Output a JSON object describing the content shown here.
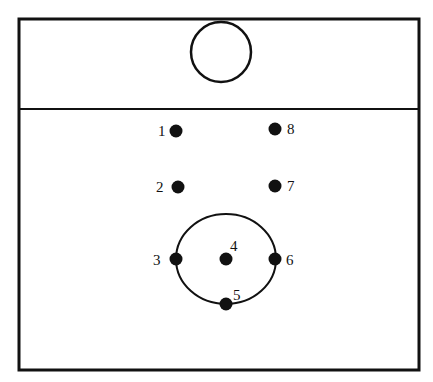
{
  "diagram": {
    "court": {
      "x": 19,
      "y": 19,
      "width": 400,
      "height": 351,
      "stroke": "#111111"
    },
    "divider_line_y": 109,
    "top_circle": {
      "cx": 221,
      "cy": 52,
      "r": 30
    },
    "formation_circle": {
      "cx": 226,
      "cy": 259,
      "rx": 50,
      "ry": 45
    },
    "players": [
      {
        "label": "1",
        "cx": 176,
        "cy": 131,
        "lx": 158,
        "ly": 136
      },
      {
        "label": "2",
        "cx": 178,
        "cy": 187,
        "lx": 156,
        "ly": 192
      },
      {
        "label": "3",
        "cx": 176,
        "cy": 259,
        "lx": 153,
        "ly": 265
      },
      {
        "label": "4",
        "cx": 226,
        "cy": 259,
        "lx": 230,
        "ly": 251
      },
      {
        "label": "5",
        "cx": 226,
        "cy": 304,
        "lx": 233,
        "ly": 300
      },
      {
        "label": "6",
        "cx": 275,
        "cy": 259,
        "lx": 286,
        "ly": 265
      },
      {
        "label": "7",
        "cx": 275,
        "cy": 186,
        "lx": 287,
        "ly": 191
      },
      {
        "label": "8",
        "cx": 275,
        "cy": 129,
        "lx": 287,
        "ly": 134
      }
    ]
  }
}
